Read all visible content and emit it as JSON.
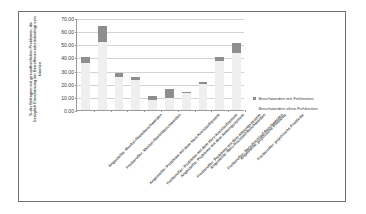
{
  "chart_data": {
    "type": "bar",
    "stacked": true,
    "title": "",
    "xlabel": "",
    "ylabel": "%-der Befragten mit gesundheitlichen Problemen, die bezüglich Einschätzung der Betroffenen arbeitsbedingt sein könnten",
    "ylim": [
      0,
      70
    ],
    "ytick_labels": [
      "0.00",
      "10.00",
      "20.00",
      "30.00",
      "40.00",
      "50.00",
      "60.00",
      "70.00"
    ],
    "ytick_values": [
      0,
      10,
      20,
      30,
      40,
      50,
      60,
      70
    ],
    "grid": true,
    "legend_position": "right",
    "categories": [
      "Angestellte: Muskel-Skeletbeschwerden",
      "Freiberufler: Muskel-Skelettbeschwerden",
      "Angestellte: Probleme mit dem Herz-Kreislaufsystem",
      "Freiberufler: Probleme mit dem Herz-Kreislaufsystem",
      "Angestellte: Probleme mit dem Atmungssystem",
      "Freiberufler: Probleme mit dem Atmungssystem",
      "Angestellte: Nerv-Kreislauf-Beschwerden",
      "Freiberufler: Nerv-Kreislauf-Beschwerden",
      "Angestellte: psychische Probleme",
      "Freiberufler: psychische Probleme"
    ],
    "series": [
      {
        "name": "Beschwerden ohne Fehlzeiten",
        "color": "#efefef",
        "values": [
          36.0,
          51.5,
          25.5,
          22.5,
          8.0,
          9.5,
          13.0,
          20.0,
          37.5,
          43.5
        ]
      },
      {
        "name": "Beschwerden mit Fehlzeiten",
        "color": "#8e8e8e",
        "values": [
          4.0,
          12.5,
          2.5,
          2.5,
          2.5,
          6.5,
          1.0,
          1.5,
          3.0,
          7.5
        ]
      }
    ],
    "totals": [
      40.0,
      64.0,
      28.0,
      25.0,
      10.5,
      16.0,
      14.0,
      21.5,
      40.5,
      51.0
    ]
  },
  "legend": {
    "items": [
      {
        "label": "Beschwerden mit Fehlzeiten",
        "color": "#8e8e8e"
      },
      {
        "label": "Beschwerden ohne Fehlzeiten",
        "color": "#efefef"
      }
    ]
  },
  "colors": {
    "frame_border": "#6e6e6e",
    "axis": "#9a9a9a",
    "gridline": "#d3d3d3",
    "text": "#3d3d3d",
    "series_with_absence": "#8e8e8e",
    "series_without_absence": "#efefef"
  }
}
